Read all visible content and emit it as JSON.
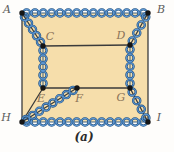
{
  "figure": {
    "caption": "(a)",
    "colors": {
      "region_fill": "#f6deab",
      "line": "#3b3b3b",
      "spring_outline": "#21507f",
      "spring_inner": "#5e97d2",
      "node_dot": "#151515",
      "label_outer": "#5c5c5c",
      "label_inner": "#8a7258",
      "caption": "#2b2b2b",
      "background": "#fefdfb"
    },
    "nodes": [
      {
        "id": "A",
        "x": 22,
        "y": 13,
        "lx": 7,
        "ly": 13,
        "group": "outer"
      },
      {
        "id": "B",
        "x": 148,
        "y": 13,
        "lx": 161,
        "ly": 13,
        "group": "outer"
      },
      {
        "id": "C",
        "x": 43,
        "y": 46,
        "lx": 50,
        "ly": 40,
        "group": "inner"
      },
      {
        "id": "D",
        "x": 130,
        "y": 45,
        "lx": 121,
        "ly": 39,
        "group": "inner"
      },
      {
        "id": "E",
        "x": 43,
        "y": 88,
        "lx": 41,
        "ly": 102,
        "group": "inner"
      },
      {
        "id": "F",
        "x": 77,
        "y": 88,
        "lx": 79,
        "ly": 102,
        "group": "inner"
      },
      {
        "id": "G",
        "x": 130,
        "y": 88,
        "lx": 121,
        "ly": 101,
        "group": "inner"
      },
      {
        "id": "H",
        "x": 22,
        "y": 122,
        "lx": 6,
        "ly": 121,
        "group": "outer"
      },
      {
        "id": "I",
        "x": 148,
        "y": 122,
        "lx": 159,
        "ly": 121,
        "group": "outer"
      }
    ],
    "region_outline": [
      "A",
      "B",
      "I",
      "H"
    ],
    "straight_edges": [
      {
        "from": "A",
        "to": "H"
      },
      {
        "from": "B",
        "to": "I"
      },
      {
        "from": "C",
        "to": "D"
      },
      {
        "from": "E",
        "to": "G"
      },
      {
        "from": "H",
        "to": "E"
      }
    ],
    "spring_edges": [
      {
        "from": "A",
        "to": "B",
        "axis": false
      },
      {
        "from": "H",
        "to": "I",
        "axis": false
      },
      {
        "from": "A",
        "to": "C",
        "axis": true
      },
      {
        "from": "B",
        "to": "D",
        "axis": true
      },
      {
        "from": "C",
        "to": "E",
        "axis": false
      },
      {
        "from": "D",
        "to": "G",
        "axis": false
      },
      {
        "from": "H",
        "to": "F",
        "axis": true
      },
      {
        "from": "G",
        "to": "I",
        "axis": true
      }
    ]
  }
}
